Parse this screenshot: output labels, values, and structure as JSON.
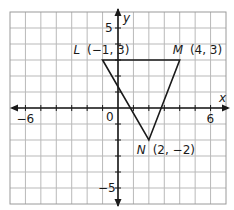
{
  "figure": {
    "type": "coordinate_plane",
    "grid": {
      "x_min": -7,
      "x_max": 7,
      "y_min": -6,
      "y_max": 6,
      "step": 1
    },
    "axes": {
      "x_label": "x",
      "y_label": "y",
      "origin_label": "0",
      "x_tick_labels": [
        {
          "value": -6,
          "text": "−6"
        },
        {
          "value": 6,
          "text": "6"
        }
      ],
      "y_tick_labels": [
        {
          "value": 5,
          "text": "5"
        },
        {
          "value": -5,
          "text": "−5"
        }
      ]
    },
    "triangle": {
      "vertices": [
        {
          "name": "L",
          "x": -1,
          "y": 3,
          "coords_text": "(−1, 3)"
        },
        {
          "name": "M",
          "x": 4,
          "y": 3,
          "coords_text": "(4, 3)"
        },
        {
          "name": "N",
          "x": 2,
          "y": -2,
          "coords_text": "(2, −2)"
        }
      ]
    },
    "colors": {
      "grid": "#b9b9b9",
      "axis": "#1a1a1a",
      "triangle": "#1a1a1a",
      "background": "#ffffff"
    }
  }
}
